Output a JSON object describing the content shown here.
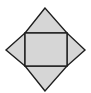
{
  "diagram": {
    "shape": "square-pyramid-net",
    "faces": [
      {
        "id": "base",
        "kind": "rectangle"
      },
      {
        "id": "top",
        "kind": "triangle"
      },
      {
        "id": "left",
        "kind": "triangle"
      },
      {
        "id": "right",
        "kind": "triangle"
      },
      {
        "id": "bottom",
        "kind": "triangle"
      }
    ],
    "colors": {
      "fill": "#d6d6d6",
      "stroke": "#1e1e1e"
    }
  }
}
